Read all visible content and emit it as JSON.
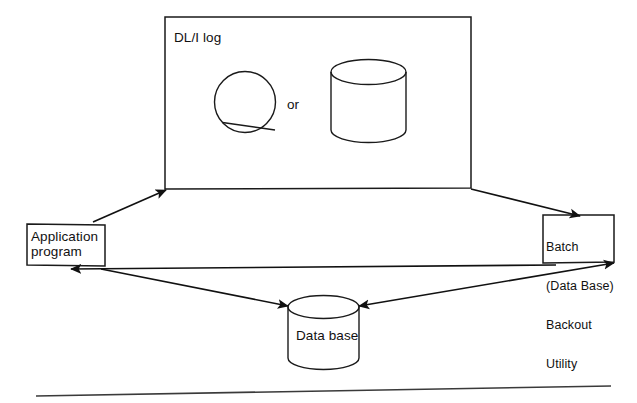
{
  "diagram": {
    "background": "#ffffff",
    "line_color": "#111111",
    "nodes": {
      "log_panel": {
        "label": "DL/I log",
        "alternative_label": "or",
        "media": [
          {
            "icon": "tape-reel-icon",
            "name": "tape reel"
          },
          {
            "icon": "disk-cylinder-icon",
            "name": "disk volume"
          }
        ]
      },
      "application_program": {
        "label": "Application\nprogram"
      },
      "batch_backout_utility": {
        "lines": [
          "Batch",
          "(Data Base)",
          "Backout",
          "Utility"
        ]
      },
      "data_base": {
        "label": "Data base",
        "icon": "disk-cylinder-icon"
      }
    },
    "connectors": [
      {
        "name": "application-program-to-dli-log",
        "from": "application_program",
        "to": "log_panel",
        "arrow": "to"
      },
      {
        "name": "dli-log-to-batch-utility",
        "from": "log_panel",
        "to": "batch_backout_utility",
        "arrow": "to"
      },
      {
        "name": "batch-utility-to-application-program",
        "from": "batch_backout_utility",
        "to": "application_program",
        "arrow": "to"
      },
      {
        "name": "application-program-to-data-base",
        "from": "application_program",
        "to": "data_base",
        "arrow": "to"
      },
      {
        "name": "data-base-to-batch-utility",
        "from": "data_base",
        "to": "batch_backout_utility",
        "arrow": "both"
      }
    ],
    "footer_rule": {
      "name": "page-rule",
      "visible": true
    }
  }
}
